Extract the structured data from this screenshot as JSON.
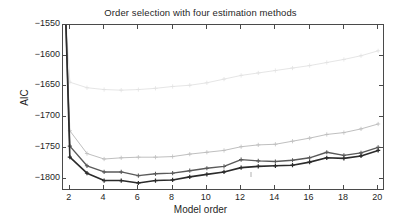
{
  "chart_data": {
    "type": "line",
    "title": "Order selection with four estimation methods",
    "xlabel": "Model order",
    "ylabel": "AIC",
    "xlim": [
      1.6,
      20.4
    ],
    "ylim": [
      -1820,
      -1550
    ],
    "xticks": [
      2,
      4,
      6,
      8,
      10,
      12,
      14,
      16,
      18,
      20
    ],
    "yticks": [
      -1550,
      -1600,
      -1650,
      -1700,
      -1750,
      -1800
    ],
    "xtick_labels": [
      "2",
      "4",
      "6",
      "8",
      "10",
      "12",
      "14",
      "16",
      "18",
      "20"
    ],
    "ytick_labels": [
      "-1550",
      "-1600",
      "-1650",
      "-1700",
      "-1750",
      "-1800"
    ],
    "grid": false,
    "legend": "none",
    "x": [
      2,
      3,
      4,
      5,
      6,
      7,
      8,
      9,
      10,
      11,
      12,
      13,
      14,
      15,
      16,
      17,
      18,
      19,
      20
    ],
    "series": [
      {
        "name": "method-1-light-gray",
        "color": "#e2e2e2",
        "marker": "plus",
        "linewidth": 0.9,
        "values": [
          -1643,
          -1652,
          -1655,
          -1656,
          -1655,
          -1653,
          -1650,
          -1648,
          -1644,
          -1638,
          -1632,
          -1628,
          -1624,
          -1620,
          -1616,
          -1611,
          -1606,
          -1600,
          -1592
        ]
      },
      {
        "name": "method-2-medium-gray",
        "color": "#bfbfbf",
        "marker": "plus",
        "linewidth": 1.0,
        "values": [
          -1722,
          -1759,
          -1768,
          -1766,
          -1765,
          -1765,
          -1764,
          -1760,
          -1757,
          -1754,
          -1748,
          -1745,
          -1744,
          -1739,
          -1734,
          -1728,
          -1725,
          -1719,
          -1711
        ]
      },
      {
        "name": "method-3-dark-gray",
        "color": "#5a5a5a",
        "marker": "plus",
        "linewidth": 1.4,
        "values": [
          -1747,
          -1779,
          -1789,
          -1789,
          -1795,
          -1792,
          -1791,
          -1787,
          -1783,
          -1780,
          -1769,
          -1771,
          -1772,
          -1770,
          -1766,
          -1757,
          -1762,
          -1758,
          -1749
        ]
      },
      {
        "name": "method-4-black",
        "color": "#2b2b2b",
        "marker": "plus",
        "linewidth": 1.6,
        "values": [
          -1765,
          -1791,
          -1803,
          -1803,
          -1807,
          -1803,
          -1802,
          -1797,
          -1793,
          -1789,
          -1782,
          -1780,
          -1779,
          -1778,
          -1773,
          -1766,
          -1767,
          -1763,
          -1754
        ]
      }
    ],
    "clipped_segment": {
      "note": "all four curves rise steeply off the top of the axes left of x=2",
      "x_at_axis": 1.75,
      "y_top": -1550
    }
  }
}
